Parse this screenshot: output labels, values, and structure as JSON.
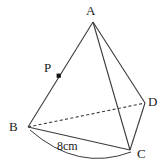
{
  "figure": {
    "type": "tetrahedron-geometry-diagram",
    "background_color": "#ffffff",
    "stroke_color": "#3a3a3a",
    "text_color": "#1a1a1a",
    "vertices": [
      {
        "id": "A",
        "label": "A",
        "x": 93,
        "y": 22
      },
      {
        "id": "B",
        "label": "B",
        "x": 28,
        "y": 127
      },
      {
        "id": "C",
        "label": "C",
        "x": 130,
        "y": 150
      },
      {
        "id": "D",
        "label": "D",
        "x": 145,
        "y": 103
      }
    ],
    "points": [
      {
        "id": "P",
        "label": "P",
        "x": 59,
        "y": 76,
        "marker": "filled-square",
        "on_edge": "AB"
      }
    ],
    "edges": [
      {
        "id": "AB",
        "from": "A",
        "to": "B",
        "style": "solid"
      },
      {
        "id": "AC",
        "from": "A",
        "to": "C",
        "style": "solid"
      },
      {
        "id": "AD",
        "from": "A",
        "to": "D",
        "style": "solid"
      },
      {
        "id": "BC",
        "from": "B",
        "to": "C",
        "style": "solid"
      },
      {
        "id": "BD",
        "from": "B",
        "to": "D",
        "style": "dashed"
      },
      {
        "id": "DC",
        "from": "D",
        "to": "C",
        "style": "solid"
      }
    ],
    "measurements": [
      {
        "id": "BC-length",
        "label": "8cm",
        "edge": "BC",
        "bracket": "arc"
      }
    ]
  }
}
